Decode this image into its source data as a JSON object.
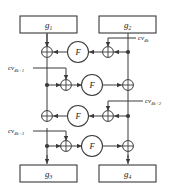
{
  "figure": {
    "background_color": "#ffffff",
    "line_color": "#3a3a3a",
    "text_color": "#1a1a1a"
  },
  "registers": {
    "top_left": {
      "name": "g",
      "sub": "1",
      "full": "g1"
    },
    "top_right": {
      "name": "g",
      "sub": "2",
      "full": "g2"
    },
    "bottom_left": {
      "name": "g",
      "sub": "3",
      "full": "g3"
    },
    "bottom_right": {
      "name": "g",
      "sub": "4",
      "full": "g4"
    }
  },
  "round_function": {
    "label": "F",
    "count": 4
  },
  "constants": [
    {
      "id": "cv-4k",
      "name": "cv",
      "sub": "4k",
      "full": "cv4k"
    },
    {
      "id": "cv-4k-1",
      "name": "cv",
      "sub": "4k+1",
      "full": "cv4k+1"
    },
    {
      "id": "cv-4k-2",
      "name": "cv",
      "sub": "4k+2",
      "full": "cv4k+2"
    },
    {
      "id": "cv-4k-3",
      "name": "cv",
      "sub": "4k+3",
      "full": "cv4k+3"
    }
  ],
  "operators": {
    "xor_symbol": "+",
    "xor_count": 8
  }
}
